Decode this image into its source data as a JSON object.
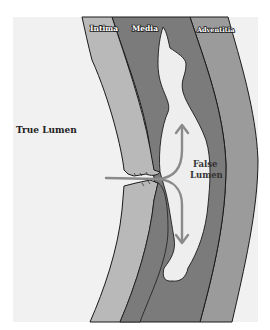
{
  "diagram": {
    "type": "aortic-dissection-cross-section",
    "labels": {
      "intima": "Intima",
      "media": "Media",
      "adventitia": "Adventitia",
      "true_lumen": "True Lumen",
      "false_lumen_line1": "False",
      "false_lumen_line2": "Lumen"
    },
    "colors": {
      "background": "#f2f2f2",
      "true_lumen": "#f0f0f0",
      "intima": "#b9b9b9",
      "media": "#7a7a7a",
      "adventitia": "#9a9a9a",
      "false_lumen": "#ededed",
      "arrow": "#8a8a8a",
      "outline": "#1a1a1a"
    },
    "arrows": [
      {
        "name": "flow-into-tear",
        "direction": "right"
      },
      {
        "name": "flow-up-false-lumen",
        "direction": "up"
      },
      {
        "name": "flow-down-false-lumen",
        "direction": "down"
      }
    ]
  }
}
